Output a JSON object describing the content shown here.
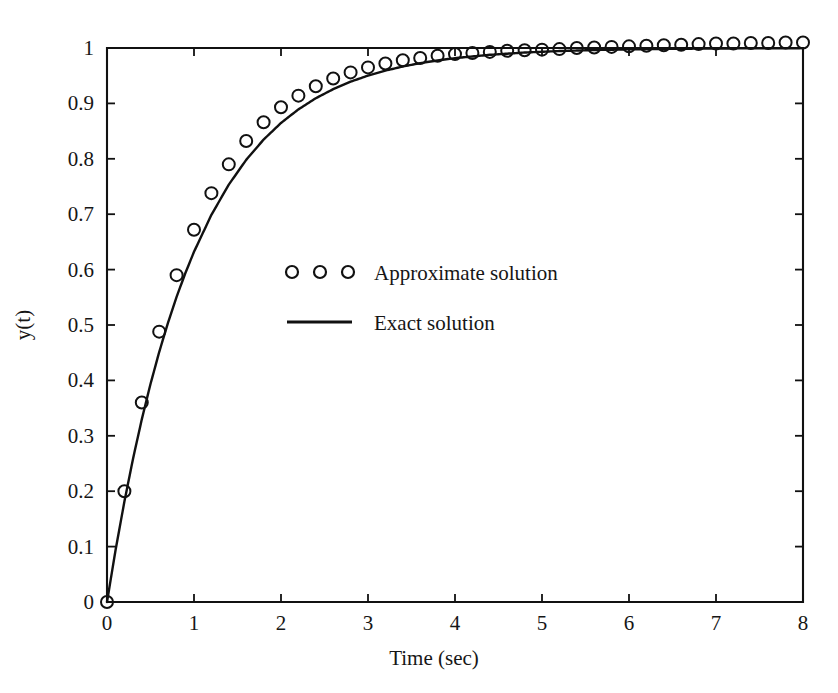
{
  "chart_data": {
    "type": "line",
    "title": "",
    "xlabel": "Time (sec)",
    "ylabel": "y(t)",
    "xlim": [
      0,
      8
    ],
    "ylim": [
      0,
      1.05
    ],
    "grid": false,
    "legend_position": "center",
    "xticks": [
      0,
      1,
      2,
      3,
      4,
      5,
      6,
      7,
      8
    ],
    "xticklabels": [
      "0",
      "1",
      "2",
      "3",
      "4",
      "5",
      "6",
      "7",
      "8"
    ],
    "yticks": [
      0,
      0.1,
      0.2,
      0.3,
      0.4,
      0.5,
      0.6,
      0.7,
      0.8,
      0.9,
      1
    ],
    "yticklabels": [
      "0",
      "0.1",
      "0.2",
      "0.3",
      "0.4",
      "0.5",
      "0.6",
      "0.7",
      "0.8",
      "0.9",
      "1"
    ],
    "series": [
      {
        "name": "Approximate solution",
        "style": "markers",
        "marker": "circle-open",
        "color": "#111111",
        "x": [
          0,
          0.2,
          0.4,
          0.6,
          0.8,
          1.0,
          1.2,
          1.4,
          1.6,
          1.8,
          2.0,
          2.2,
          2.4,
          2.6,
          2.8,
          3.0,
          3.2,
          3.4,
          3.6,
          3.8,
          4.0,
          4.2,
          4.4,
          4.6,
          4.8,
          5.0,
          5.2,
          5.4,
          5.6,
          5.8,
          6.0,
          6.2,
          6.4,
          6.6,
          6.8,
          7.0,
          7.2,
          7.4,
          7.6,
          7.8,
          8.0
        ],
        "y": [
          0.0,
          0.2,
          0.36,
          0.488,
          0.59,
          0.672,
          0.738,
          0.79,
          0.832,
          0.866,
          0.893,
          0.914,
          0.931,
          0.945,
          0.956,
          0.965,
          0.972,
          0.978,
          0.982,
          0.986,
          0.989,
          0.991,
          0.993,
          0.995,
          0.996,
          0.997,
          0.998,
          1.0,
          1.001,
          1.002,
          1.003,
          1.004,
          1.005,
          1.006,
          1.007,
          1.008,
          1.008,
          1.009,
          1.009,
          1.01,
          1.01
        ]
      },
      {
        "name": "Exact solution",
        "style": "line",
        "color": "#111111",
        "equation": "y(t) = 1 - exp(-t)",
        "x": [
          0,
          0.1,
          0.2,
          0.3,
          0.4,
          0.5,
          0.6,
          0.7,
          0.8,
          0.9,
          1.0,
          1.2,
          1.4,
          1.6,
          1.8,
          2.0,
          2.2,
          2.4,
          2.6,
          2.8,
          3.0,
          3.2,
          3.4,
          3.6,
          3.8,
          4.0,
          4.4,
          4.8,
          5.2,
          5.6,
          6.0,
          6.5,
          7.0,
          7.5,
          8.0
        ],
        "y": [
          0.0,
          0.0952,
          0.1813,
          0.2592,
          0.3297,
          0.3935,
          0.4512,
          0.5034,
          0.5507,
          0.5934,
          0.6321,
          0.6988,
          0.7534,
          0.7981,
          0.8347,
          0.8647,
          0.8892,
          0.9093,
          0.9257,
          0.9392,
          0.9502,
          0.9592,
          0.9666,
          0.9727,
          0.9776,
          0.9817,
          0.9877,
          0.9918,
          0.9945,
          0.9963,
          0.9975,
          0.9985,
          0.9991,
          0.9994,
          0.9997
        ]
      }
    ]
  },
  "legend": {
    "entries": [
      {
        "label": "Approximate solution",
        "symbol": "circle-markers"
      },
      {
        "label": "Exact solution",
        "symbol": "solid-line"
      }
    ]
  },
  "colors": {
    "background": "#ffffff",
    "ink": "#111111",
    "text": "#161616"
  }
}
